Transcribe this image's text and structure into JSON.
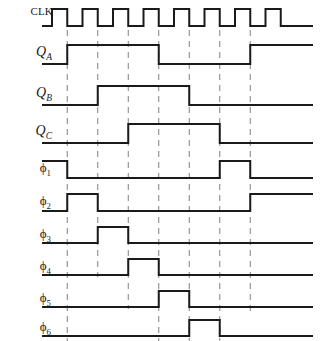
{
  "figure": {
    "type": "digital-timing-diagram",
    "title": "",
    "background_color": "#ffffff",
    "line_color": "#1a1a1a",
    "gridline_color": "#808080",
    "width": 321,
    "height": 341
  },
  "axis": {
    "plot_left": 52,
    "plot_right": 313,
    "cycle_width": 30.5,
    "num_clock_pulses": 8,
    "num_gridlines": 7,
    "gridline_positions": [
      52,
      82.5,
      113,
      143.5,
      174,
      204.5,
      235,
      265.5
    ]
  },
  "labels": {
    "clk": "CLK",
    "qa": "Q",
    "qa_sub": "A",
    "qb": "Q",
    "qb_sub": "B",
    "qc": "Q",
    "qc_sub": "C",
    "phi1": "ϕ",
    "phi1_sub": "1",
    "phi2": "ϕ",
    "phi2_sub": "2",
    "phi3": "ϕ",
    "phi3_sub": "3",
    "phi4": "ϕ",
    "phi4_sub": "4",
    "phi5": "ϕ",
    "phi5_sub": "5",
    "phi6": "ϕ",
    "phi6_sub": "6"
  },
  "chart_data": {
    "type": "line",
    "title": "",
    "xlabel": "",
    "ylabel": "",
    "grid": true,
    "legend": "none",
    "time_unit": "clock half-cycle index",
    "x_range": [
      0,
      17.5
    ],
    "signals": [
      {
        "name": "CLK",
        "row": 0,
        "initial_level": 0,
        "description": "Square wave clock, 8 pulses, 50% duty cycle",
        "transitions": [
          {
            "t": 0.5,
            "level": 1
          },
          {
            "t": 1.5,
            "level": 0
          },
          {
            "t": 2.5,
            "level": 1
          },
          {
            "t": 3.5,
            "level": 0
          },
          {
            "t": 4.5,
            "level": 1
          },
          {
            "t": 5.5,
            "level": 0
          },
          {
            "t": 6.5,
            "level": 1
          },
          {
            "t": 7.5,
            "level": 0
          },
          {
            "t": 8.5,
            "level": 1
          },
          {
            "t": 9.5,
            "level": 0
          },
          {
            "t": 10.5,
            "level": 1
          },
          {
            "t": 11.5,
            "level": 0
          },
          {
            "t": 12.5,
            "level": 1
          },
          {
            "t": 13.5,
            "level": 0
          },
          {
            "t": 14.5,
            "level": 1
          },
          {
            "t": 15.5,
            "level": 0
          }
        ]
      },
      {
        "name": "QA",
        "row": 1,
        "initial_level": 0,
        "description": "High for 3 clock cycles starting at gridline 1",
        "transitions": [
          {
            "t": 1.5,
            "level": 1
          },
          {
            "t": 7.5,
            "level": 0
          },
          {
            "t": 13.5,
            "level": 1
          }
        ]
      },
      {
        "name": "QB",
        "row": 2,
        "initial_level": 0,
        "description": "High for 3 clock cycles starting at gridline 2",
        "transitions": [
          {
            "t": 3.5,
            "level": 1
          },
          {
            "t": 9.5,
            "level": 0
          }
        ]
      },
      {
        "name": "QC",
        "row": 3,
        "initial_level": 0,
        "description": "High for 3 clock cycles starting at gridline 3",
        "transitions": [
          {
            "t": 5.5,
            "level": 1
          },
          {
            "t": 11.5,
            "level": 0
          }
        ]
      },
      {
        "name": "phi1",
        "row": 4,
        "initial_level": 1,
        "description": "Starts high, falls at gridline 1, single pulse between gridlines 6 and 7",
        "transitions": [
          {
            "t": 1.5,
            "level": 0
          },
          {
            "t": 11.5,
            "level": 1
          },
          {
            "t": 13.5,
            "level": 0
          }
        ]
      },
      {
        "name": "phi2",
        "row": 5,
        "initial_level": 0,
        "description": "Pulse between gridlines 1 and 2, rises again at gridline 7",
        "transitions": [
          {
            "t": 1.5,
            "level": 1
          },
          {
            "t": 3.5,
            "level": 0
          },
          {
            "t": 13.5,
            "level": 1
          }
        ]
      },
      {
        "name": "phi3",
        "row": 6,
        "initial_level": 0,
        "description": "Single pulse between gridlines 2 and 3",
        "transitions": [
          {
            "t": 3.5,
            "level": 1
          },
          {
            "t": 5.5,
            "level": 0
          }
        ]
      },
      {
        "name": "phi4",
        "row": 7,
        "initial_level": 0,
        "description": "Single pulse between gridlines 3 and 4",
        "transitions": [
          {
            "t": 5.5,
            "level": 1
          },
          {
            "t": 7.5,
            "level": 0
          }
        ]
      },
      {
        "name": "phi5",
        "row": 8,
        "initial_level": 0,
        "description": "Single pulse between gridlines 4 and 5",
        "transitions": [
          {
            "t": 7.5,
            "level": 1
          },
          {
            "t": 9.5,
            "level": 0
          }
        ]
      },
      {
        "name": "phi6",
        "row": 9,
        "initial_level": 0,
        "description": "Single pulse between gridlines 5 and 6",
        "transitions": [
          {
            "t": 9.5,
            "level": 1
          },
          {
            "t": 11.5,
            "level": 0
          }
        ]
      }
    ]
  },
  "rows": {
    "clk": {
      "baseline": 26,
      "top": 9,
      "label_y": 6
    },
    "qa": {
      "baseline": 64,
      "top": 45,
      "label_y": 46
    },
    "qb": {
      "baseline": 105,
      "top": 86,
      "label_y": 87
    },
    "qc": {
      "baseline": 143,
      "top": 124,
      "label_y": 125
    },
    "phi1": {
      "baseline": 178,
      "top": 161,
      "label_y": 162
    },
    "phi2": {
      "baseline": 211,
      "top": 194,
      "label_y": 195
    },
    "phi3": {
      "baseline": 243,
      "top": 227,
      "label_y": 228
    },
    "phi4": {
      "baseline": 275,
      "top": 259,
      "label_y": 260
    },
    "phi5": {
      "baseline": 307,
      "top": 291,
      "label_y": 292
    },
    "phi6": {
      "baseline": 336,
      "top": 320,
      "label_y": 321
    }
  },
  "gridline_extents": {
    "g1": {
      "y1": 30,
      "y2": 341
    },
    "g2": {
      "y1": 30,
      "y2": 277
    },
    "g3": {
      "y1": 30,
      "y2": 309
    },
    "g4": {
      "y1": 30,
      "y2": 341
    },
    "g5": {
      "y1": 30,
      "y2": 341
    },
    "g6": {
      "y1": 30,
      "y2": 341
    },
    "g7": {
      "y1": 30,
      "y2": 315
    }
  }
}
